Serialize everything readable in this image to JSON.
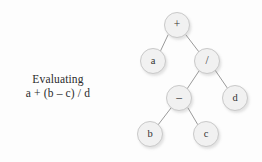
{
  "figure": {
    "background_color": "#fdfdfd",
    "node_fill_color": "#f1f1f1",
    "node_border_color": "#c9c9c9",
    "edge_color": "#9a9a9a",
    "text_color": "#2b2b2b"
  },
  "caption": {
    "line1": "Evaluating",
    "line2": "a + (b – c) / d"
  },
  "tree": {
    "nodes": [
      {
        "id": "root",
        "label": "+",
        "kind": "operator",
        "cx": 177,
        "cy": 25
      },
      {
        "id": "a",
        "label": "a",
        "kind": "operand",
        "cx": 153,
        "cy": 61
      },
      {
        "id": "divide",
        "label": "/",
        "kind": "operator",
        "cx": 207,
        "cy": 61
      },
      {
        "id": "minus",
        "label": "–",
        "kind": "operator",
        "cx": 179,
        "cy": 98
      },
      {
        "id": "d",
        "label": "d",
        "kind": "operand",
        "cx": 235,
        "cy": 98
      },
      {
        "id": "b",
        "label": "b",
        "kind": "operand",
        "cx": 150,
        "cy": 134
      },
      {
        "id": "c",
        "label": "c",
        "kind": "operand",
        "cx": 206,
        "cy": 134
      }
    ],
    "edges": [
      {
        "from": "root",
        "to": "a",
        "x1": 168,
        "y1": 35,
        "x2": 160,
        "y2": 52
      },
      {
        "from": "root",
        "to": "divide",
        "x1": 186,
        "y1": 35,
        "x2": 199,
        "y2": 52
      },
      {
        "from": "divide",
        "to": "minus",
        "x1": 199,
        "y1": 71,
        "x2": 187,
        "y2": 89
      },
      {
        "from": "divide",
        "to": "d",
        "x1": 215,
        "y1": 70,
        "x2": 228,
        "y2": 89
      },
      {
        "from": "minus",
        "to": "b",
        "x1": 171,
        "y1": 108,
        "x2": 158,
        "y2": 125
      },
      {
        "from": "minus",
        "to": "c",
        "x1": 188,
        "y1": 108,
        "x2": 198,
        "y2": 125
      }
    ]
  }
}
